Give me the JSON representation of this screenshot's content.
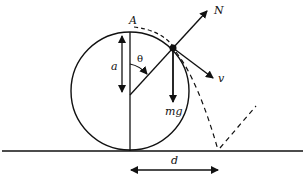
{
  "labels": {
    "A": "A",
    "N": "N",
    "a": "a",
    "theta": "θ",
    "v": "v",
    "mg": "mg",
    "d": "d"
  },
  "colors": {
    "ink": "#111111",
    "background": "#ffffff"
  }
}
